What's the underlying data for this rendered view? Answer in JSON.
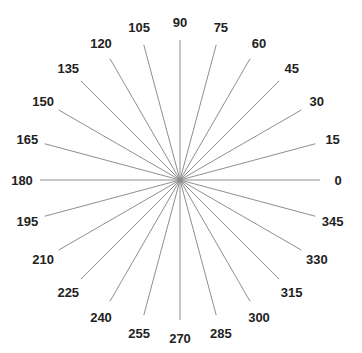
{
  "figure": {
    "background_color": "#ffffff",
    "width": 362,
    "height": 353
  },
  "chart_data": {
    "type": "scatter",
    "title": "",
    "subtitle": "",
    "xlabel": "",
    "ylabel": "",
    "coordinate_system": "polar",
    "grid": false,
    "legend": null,
    "center": {
      "x": 180,
      "y": 180
    },
    "radius": 140,
    "label_radius": 158,
    "angle_step_degrees": 15,
    "angle_start_degrees": 0,
    "angle_unit": "degrees",
    "angle_direction": "counterclockwise",
    "zero_direction": "east",
    "spoke_count": 24,
    "spoke_color": "#8f8f8f",
    "spoke_width": 1,
    "label_color": "#222222",
    "categories": [
      "0",
      "15",
      "30",
      "45",
      "60",
      "75",
      "90",
      "105",
      "120",
      "135",
      "150",
      "165",
      "180",
      "195",
      "210",
      "225",
      "240",
      "255",
      "270",
      "285",
      "300",
      "315",
      "330",
      "345"
    ],
    "values": [
      140,
      140,
      140,
      140,
      140,
      140,
      140,
      140,
      140,
      140,
      140,
      140,
      140,
      140,
      140,
      140,
      140,
      140,
      140,
      140,
      140,
      140,
      140,
      140
    ],
    "spokes": [
      {
        "label": "0",
        "angle": 0,
        "length": 140
      },
      {
        "label": "15",
        "angle": 15,
        "length": 140
      },
      {
        "label": "30",
        "angle": 30,
        "length": 140
      },
      {
        "label": "45",
        "angle": 45,
        "length": 140
      },
      {
        "label": "60",
        "angle": 60,
        "length": 140
      },
      {
        "label": "75",
        "angle": 75,
        "length": 140
      },
      {
        "label": "90",
        "angle": 90,
        "length": 140
      },
      {
        "label": "105",
        "angle": 105,
        "length": 140
      },
      {
        "label": "120",
        "angle": 120,
        "length": 140
      },
      {
        "label": "135",
        "angle": 135,
        "length": 140
      },
      {
        "label": "150",
        "angle": 150,
        "length": 140
      },
      {
        "label": "165",
        "angle": 165,
        "length": 140
      },
      {
        "label": "180",
        "angle": 180,
        "length": 140
      },
      {
        "label": "195",
        "angle": 195,
        "length": 140
      },
      {
        "label": "210",
        "angle": 210,
        "length": 140
      },
      {
        "label": "225",
        "angle": 225,
        "length": 140
      },
      {
        "label": "240",
        "angle": 240,
        "length": 140
      },
      {
        "label": "255",
        "angle": 255,
        "length": 140
      },
      {
        "label": "270",
        "angle": 270,
        "length": 140
      },
      {
        "label": "285",
        "angle": 285,
        "length": 140
      },
      {
        "label": "300",
        "angle": 300,
        "length": 140
      },
      {
        "label": "315",
        "angle": 315,
        "length": 140
      },
      {
        "label": "330",
        "angle": 330,
        "length": 140
      },
      {
        "label": "345",
        "angle": 345,
        "length": 140
      }
    ]
  }
}
